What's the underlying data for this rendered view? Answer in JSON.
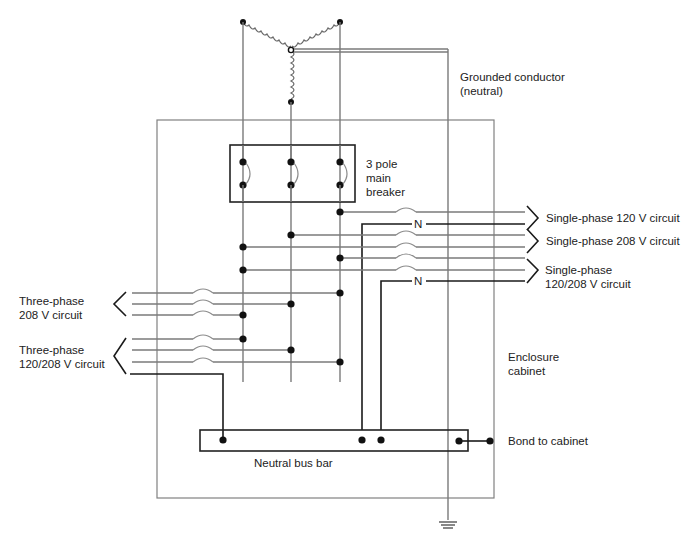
{
  "diagram": {
    "type": "electrical-panel-wiring",
    "labels": {
      "grounded_conductor": "Grounded conductor\n(neutral)",
      "main_breaker": "3 pole\nmain\nbreaker",
      "single_120": "Single-phase 120 V circuit",
      "single_208": "Single-phase 208 V circuit",
      "single_120_208": "Single-phase\n120/208 V circuit",
      "three_208": "Three-phase\n208 V circuit",
      "three_120_208": "Three-phase\n120/208 V circuit",
      "enclosure": "Enclosure\ncabinet",
      "neutral_bus": "Neutral bus bar",
      "bond": "Bond to cabinet",
      "neutral_marker": "N"
    },
    "components": [
      {
        "id": "wye-transformer",
        "label": "Wye secondary (3 coils)"
      },
      {
        "id": "main-breaker",
        "label": "3 pole main breaker",
        "poles": 3
      },
      {
        "id": "bus-a",
        "label": "Phase bus A"
      },
      {
        "id": "bus-b",
        "label": "Phase bus B"
      },
      {
        "id": "bus-c",
        "label": "Phase bus C"
      },
      {
        "id": "neutral-bus-bar",
        "label": "Neutral bus bar"
      },
      {
        "id": "enclosure",
        "label": "Enclosure cabinet"
      },
      {
        "id": "ground",
        "label": "Earth ground"
      }
    ],
    "circuits": [
      {
        "name": "Single-phase 120 V circuit",
        "side": "right",
        "phases": [
          "C"
        ],
        "neutral": true,
        "fuses": 1
      },
      {
        "name": "Single-phase 208 V circuit",
        "side": "right",
        "phases": [
          "B",
          "A"
        ],
        "neutral": false,
        "fuses": 2
      },
      {
        "name": "Single-phase 120/208 V circuit",
        "side": "right",
        "phases": [
          "C",
          "A"
        ],
        "neutral": true,
        "fuses": 2
      },
      {
        "name": "Three-phase 208 V circuit",
        "side": "left",
        "phases": [
          "C",
          "B",
          "A"
        ],
        "neutral": false,
        "fuses": 3
      },
      {
        "name": "Three-phase 120/208 V circuit",
        "side": "left",
        "phases": [
          "A",
          "B",
          "C"
        ],
        "neutral": true,
        "fuses": 3
      }
    ],
    "caption_visible": "(caption cut off at bottom edge — illegible)"
  }
}
